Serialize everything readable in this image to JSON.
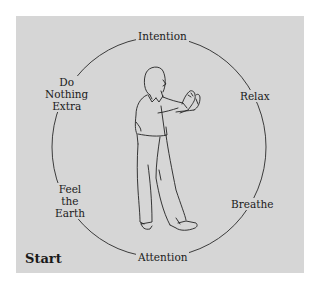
{
  "diagram": {
    "title": "",
    "background_color": "#d6d6d6",
    "stroke_color": "#2a2a2a",
    "start_label": "Start",
    "cycle": [
      {
        "id": "intention",
        "label": "Intention"
      },
      {
        "id": "relax",
        "label": "Relax"
      },
      {
        "id": "breathe",
        "label": "Breathe"
      },
      {
        "id": "attention",
        "label": "Attention"
      },
      {
        "id": "feel-the-earth",
        "label": "Feel the Earth",
        "lines": [
          "Feel",
          "the",
          "Earth"
        ]
      },
      {
        "id": "do-nothing-extra",
        "label": "Do Nothing Extra",
        "lines": [
          "Do",
          "Nothing",
          "Extra"
        ]
      }
    ],
    "center_figure": "standing-person-tai-chi-pose-icon"
  }
}
